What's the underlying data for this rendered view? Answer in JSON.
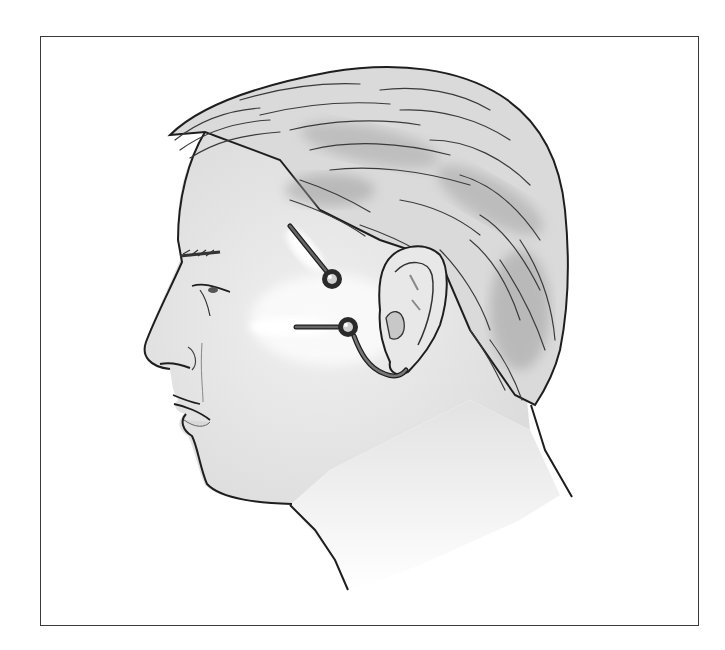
{
  "figure": {
    "frame": {
      "x": 40,
      "y": 36,
      "width": 659,
      "height": 590,
      "border_color": "#3a3a3a"
    },
    "colors": {
      "outline": "#1e1e1e",
      "skin": "#ebebeb",
      "skin_shadow": "#cfcfcf",
      "hair_base": "#d9d9d9",
      "hair_shade": "#9a9a9a",
      "hair_stroke": "#3a3a3a",
      "electrode_ring": "#2a2a2a",
      "electrode_center": "#cfcfcf",
      "lead_wire": "#555555",
      "glow": "#ffffff"
    },
    "electrodes": [
      {
        "id": "upper",
        "cx": 332,
        "cy": 279,
        "r": 10,
        "lead_from": [
          290,
          226
        ]
      },
      {
        "id": "lower",
        "cx": 348,
        "cy": 327,
        "r": 10,
        "lead_from": [
          296,
          327
        ],
        "lead_to_behind_ear": [
          402,
          372
        ]
      }
    ]
  }
}
